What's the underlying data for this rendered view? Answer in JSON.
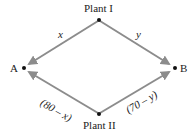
{
  "nodes": {
    "plant1": {
      "label": "Plant I"
    },
    "plant2": {
      "label": "Plant II"
    },
    "a": {
      "label": "A"
    },
    "b": {
      "label": "B"
    }
  },
  "edges": {
    "p1_to_a": {
      "label": "x"
    },
    "p1_to_b": {
      "label": "y"
    },
    "p2_to_a": {
      "label": "(80 – x)"
    },
    "p2_to_b": {
      "label": "(70 – y)"
    }
  },
  "colors": {
    "arrow": "#8c8c8c",
    "dot": "#111111"
  }
}
